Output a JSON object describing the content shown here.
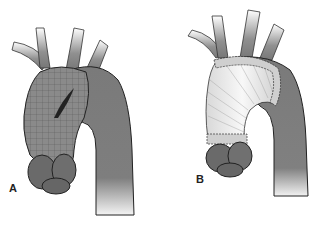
{
  "figure": {
    "panels": [
      {
        "label": "A",
        "description": "Aortic arch aneurysm with mesh wrap and dissection tear"
      },
      {
        "label": "B",
        "description": "Ascending aorta replaced with tubular graft, sutured anastomoses"
      }
    ]
  }
}
